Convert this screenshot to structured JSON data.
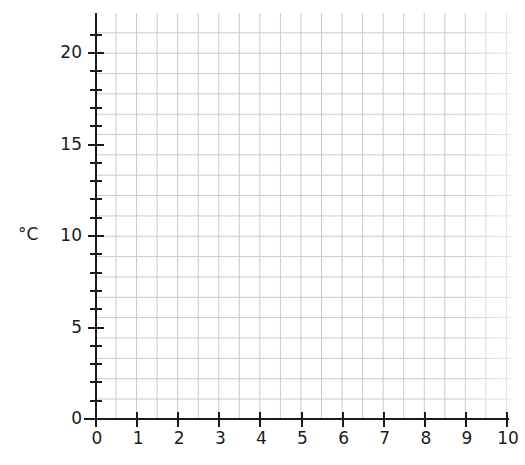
{
  "chart_data": {
    "type": "line",
    "title": "",
    "subtitle": "",
    "xlabel": "",
    "ylabel": "°C",
    "xlim": [
      0,
      10
    ],
    "ylim": [
      0,
      20
    ],
    "x_major_ticks": [
      0,
      1,
      2,
      3,
      4,
      5,
      6,
      7,
      8,
      9,
      10
    ],
    "x_tick_labels": [
      "0",
      "1",
      "2",
      "3",
      "4",
      "5",
      "6",
      "7",
      "8",
      "9",
      "10"
    ],
    "x_minor_ticks": [],
    "y_major_ticks": [
      0,
      5,
      10,
      15,
      20
    ],
    "y_tick_labels": [
      "0",
      "5",
      "10",
      "15",
      "20"
    ],
    "y_minor_ticks": [
      1,
      2,
      3,
      4,
      6,
      7,
      8,
      9,
      11,
      12,
      13,
      14,
      16,
      17,
      18,
      19,
      21
    ],
    "grid": true,
    "grid_color": "#c9c9ce",
    "axis_color": "#1b1b1b",
    "background": "#ffffff",
    "legend": null,
    "legend_position": "none",
    "series": [],
    "annotations": []
  },
  "axes": {
    "y_title": "°C",
    "y_labels": [
      {
        "value": 20,
        "text": "20"
      },
      {
        "value": 15,
        "text": "15"
      },
      {
        "value": 10,
        "text": "10"
      },
      {
        "value": 5,
        "text": "5"
      },
      {
        "value": 0,
        "text": "0"
      }
    ],
    "x_labels": [
      {
        "value": 0,
        "text": "0"
      },
      {
        "value": 1,
        "text": "1"
      },
      {
        "value": 2,
        "text": "2"
      },
      {
        "value": 3,
        "text": "3"
      },
      {
        "value": 4,
        "text": "4"
      },
      {
        "value": 5,
        "text": "5"
      },
      {
        "value": 6,
        "text": "6"
      },
      {
        "value": 7,
        "text": "7"
      },
      {
        "value": 8,
        "text": "8"
      },
      {
        "value": 9,
        "text": "9"
      },
      {
        "value": 10,
        "text": "10"
      }
    ]
  }
}
